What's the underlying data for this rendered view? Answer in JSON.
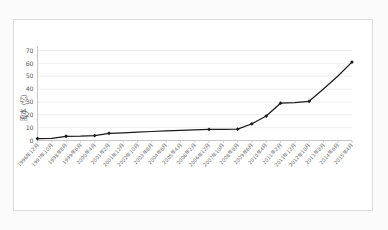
{
  "chart_data": {
    "type": "line",
    "title": "",
    "xlabel": "",
    "ylabel": "股本（亿）",
    "ylim": [
      0,
      70
    ],
    "yticks": [
      0,
      10,
      20,
      30,
      40,
      50,
      60,
      70
    ],
    "grid": true,
    "legend": false,
    "legend_position": "none",
    "line_color": "#1a1a1a",
    "marker": "diamond",
    "categories": [
      "1996年12月",
      "1997年10月",
      "1998年8月",
      "1999年6月",
      "2000年4月",
      "2001年2月",
      "2001年12月",
      "2002年10月",
      "2003年8月",
      "2004年6月",
      "2005年4月",
      "2006年2月",
      "2006年12月",
      "2007年10月",
      "2008年8月",
      "2009年6月",
      "2010年4月",
      "2011年2月",
      "2011年12月",
      "2012年10月",
      "2013年8月",
      "2014年6月",
      "2015年4月"
    ],
    "values": [
      1.5,
      1.6,
      3.3,
      3.4,
      3.8,
      5.6,
      6.0,
      6.6,
      7.0,
      7.4,
      7.8,
      8.3,
      8.6,
      8.7,
      8.8,
      13.0,
      19.0,
      29.0,
      29.5,
      30.5,
      40.0,
      50.0,
      61.0
    ],
    "marker_indices": [
      0,
      2,
      4,
      5,
      12,
      14,
      15,
      16,
      17,
      19,
      22
    ]
  },
  "figure": {
    "background_color": "#fbfbfb",
    "plot_background_color": "#ffffff",
    "border_color": "#dcdcdc",
    "gridline_color": "#e3e3e3"
  }
}
